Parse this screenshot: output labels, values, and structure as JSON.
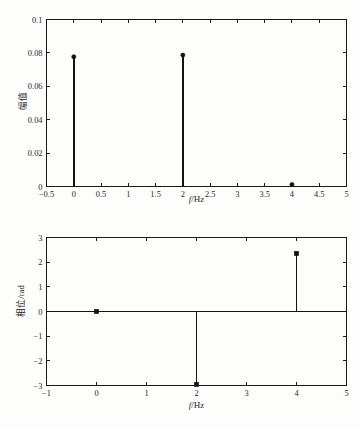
{
  "figure": {
    "background_color": "#fdfdfb",
    "line_color": "#121212"
  },
  "chart_data": [
    {
      "id": "amplitude-spectrum",
      "type": "bar",
      "title": "",
      "subtitle": "",
      "xlabel": "f/Hz",
      "xlabel_italic_part": "f",
      "xlabel_rest": "/Hz",
      "ylabel": "幅值",
      "grid": false,
      "legend": "none",
      "xlim": [
        -0.5,
        5
      ],
      "ylim": [
        0,
        0.1
      ],
      "xticks": [
        -0.5,
        0,
        0.5,
        1,
        1.5,
        2,
        2.5,
        3,
        3.5,
        4,
        4.5,
        5
      ],
      "xticklabels": [
        "−0.5",
        "0",
        "0.5",
        "1",
        "1.5",
        "2",
        "2.5",
        "3",
        "3.5",
        "4",
        "4.5",
        "5"
      ],
      "yticks": [
        0,
        0.02,
        0.04,
        0.06,
        0.08,
        0.1
      ],
      "yticklabels": [
        "0",
        "0.02",
        "0.04",
        "0.06",
        "0.08",
        "0.1"
      ],
      "x": [
        0,
        2,
        4
      ],
      "values": [
        0.0777,
        0.0787,
        0.0012
      ],
      "marker": "filled-circle",
      "annotations": []
    },
    {
      "id": "phase-spectrum",
      "type": "bar",
      "title": "",
      "subtitle": "",
      "xlabel": "f/Hz",
      "xlabel_italic_part": "f",
      "xlabel_rest": "/Hz",
      "ylabel": "相位/rad",
      "grid": false,
      "legend": "none",
      "xlim": [
        -1,
        5
      ],
      "ylim": [
        -3,
        3
      ],
      "xticks": [
        -1,
        0,
        1,
        2,
        3,
        4,
        5
      ],
      "xticklabels": [
        "−1",
        "0",
        "1",
        "2",
        "3",
        "4",
        "5"
      ],
      "yticks": [
        -3,
        -2,
        -1,
        0,
        1,
        2,
        3
      ],
      "yticklabels": [
        "−3",
        "−2",
        "−1",
        "0",
        "1",
        "2",
        "3"
      ],
      "x": [
        0,
        2,
        4
      ],
      "values": [
        0.0,
        -2.96,
        2.35
      ],
      "marker": "filled-square",
      "baseline": 0,
      "annotations": []
    }
  ]
}
